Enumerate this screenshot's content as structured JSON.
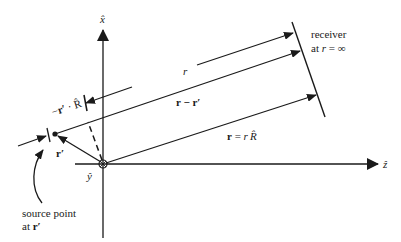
{
  "figure": {
    "axes": {
      "x_axis_label": "x̂",
      "z_axis_label": "ẑ",
      "y_axis_label": "ŷ"
    },
    "labels": {
      "receiver_line1": "receiver",
      "receiver_line2_prefix": "at ",
      "receiver_line2_var": "r",
      "receiver_line2_suffix": " = ∞",
      "r_distance": "r",
      "r_minus_rprime": "r − r′",
      "r_equals_rR": "r = r R̂",
      "r_equals_rR_lhs": "r",
      "r_equals_rR_eq": " = ",
      "r_equals_rR_rhs": "r",
      "r_equals_rR_unit": "R̂",
      "projection": "−r′ · R̂",
      "projection_minus": "−",
      "projection_r": "r′",
      "projection_dot": " · R̂",
      "rprime": "r′",
      "source_line1": "source point",
      "source_line2_prefix": "at ",
      "source_line2_var": "r′"
    },
    "colors": {
      "ink": "#1a1a1a",
      "background": "#ffffff"
    }
  }
}
